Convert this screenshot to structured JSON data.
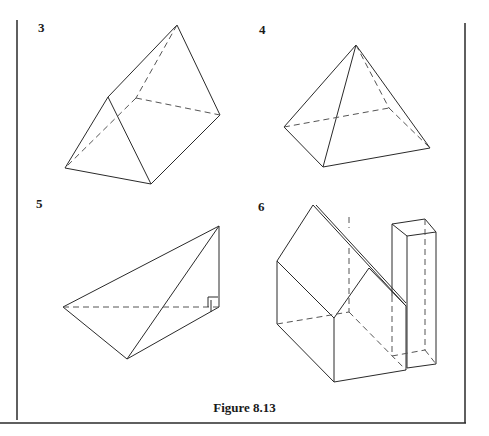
{
  "figure": {
    "caption": "Figure 8.13",
    "panels": [
      {
        "label": "3",
        "shape": "triangular-prism"
      },
      {
        "label": "4",
        "shape": "square-pyramid"
      },
      {
        "label": "5",
        "shape": "right-angled-tetrahedron"
      },
      {
        "label": "6",
        "shape": "house-with-chimney"
      }
    ]
  }
}
